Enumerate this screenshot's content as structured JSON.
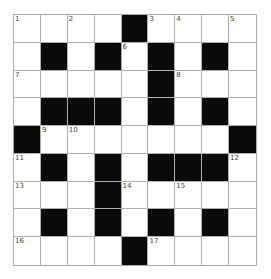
{
  "puzzle": {
    "rows": 9,
    "cols": 9,
    "layout": [
      "W.W.#WWWW",
      "W#W#W#W#W",
      "WWWWW#WWW",
      "W###W#W#W",
      "#WWWWWWW#",
      "W#W#W###W",
      "WWW#WWWWW",
      "W#W#W#W#W",
      "WWWW#WWWW"
    ],
    "numbers": [
      {
        "row": 0,
        "col": 0,
        "n": "1"
      },
      {
        "row": 0,
        "col": 2,
        "n": "2"
      },
      {
        "row": 0,
        "col": 5,
        "n": "3"
      },
      {
        "row": 0,
        "col": 6,
        "n": "4"
      },
      {
        "row": 0,
        "col": 8,
        "n": "5"
      },
      {
        "row": 1,
        "col": 4,
        "n": "6"
      },
      {
        "row": 2,
        "col": 0,
        "n": "7"
      },
      {
        "row": 2,
        "col": 6,
        "n": "8"
      },
      {
        "row": 4,
        "col": 1,
        "n": "9"
      },
      {
        "row": 4,
        "col": 2,
        "n": "10"
      },
      {
        "row": 5,
        "col": 0,
        "n": "11"
      },
      {
        "row": 5,
        "col": 8,
        "n": "12"
      },
      {
        "row": 6,
        "col": 0,
        "n": "13"
      },
      {
        "row": 6,
        "col": 4,
        "n": "14"
      },
      {
        "row": 6,
        "col": 6,
        "n": "15"
      },
      {
        "row": 8,
        "col": 0,
        "n": "16"
      },
      {
        "row": 8,
        "col": 5,
        "n": "17"
      }
    ],
    "colors": {
      "block": "#0a0a0a",
      "cell": "#ffffff",
      "line": "#b0b0b0"
    }
  }
}
